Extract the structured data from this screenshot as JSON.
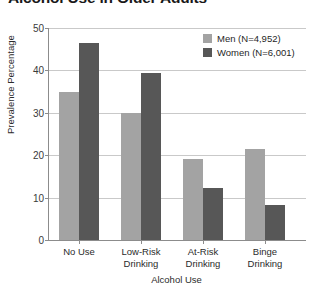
{
  "chart_data": {
    "type": "bar",
    "title": "Alcohol Use in Older Adults",
    "xlabel": "Alcohol Use",
    "ylabel": "Prevalence Percentage",
    "categories": [
      "No Use",
      "Low-Risk\nDrinking",
      "At-Risk\nDrinking",
      "Binge\nDrinking"
    ],
    "series": [
      {
        "name": "Men (N=4,952)",
        "color": "#a3a3a3",
        "values": [
          35.0,
          30.0,
          19.0,
          21.5
        ]
      },
      {
        "name": "Women (N=6,001)",
        "color": "#575757",
        "values": [
          46.5,
          39.3,
          12.3,
          8.3
        ]
      }
    ],
    "ylim": [
      0,
      50
    ],
    "yticks": [
      0,
      10,
      20,
      30,
      40,
      50
    ],
    "ytick_labels": [
      "0",
      "10",
      "20",
      "30",
      "40",
      "50"
    ],
    "grid": true,
    "legend_position": "top-right"
  },
  "legend": {
    "items": [
      {
        "label": "Men (N=4,952)"
      },
      {
        "label": "Women (N=6,001)"
      }
    ]
  }
}
